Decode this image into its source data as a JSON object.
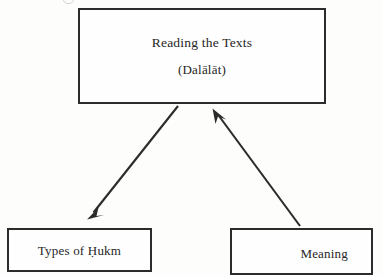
{
  "diagram": {
    "type": "hierarchy-flow",
    "title_node": {
      "name": "root-node",
      "line1": "Reading the Texts",
      "line2": "(Dalālāt)"
    },
    "children": [
      {
        "name": "types-of-hukm-node",
        "label": "Types of Ḥukm"
      },
      {
        "name": "meaning-node",
        "label": "Meaning"
      }
    ],
    "connectors": [
      {
        "name": "arrow-root-to-hukm",
        "from": "root-node",
        "to": "types-of-hukm-node",
        "direction": "down-left",
        "arrowhead_at": "types-of-hukm-node"
      },
      {
        "name": "arrow-meaning-to-root",
        "from": "meaning-node",
        "to": "root-node",
        "direction": "up-left",
        "arrowhead_at": "root-node"
      }
    ],
    "colors": {
      "ink": "#2b2b2b",
      "text": "#262626",
      "page_background": "#fdfdfb",
      "box_fill": "#fefefe"
    }
  }
}
